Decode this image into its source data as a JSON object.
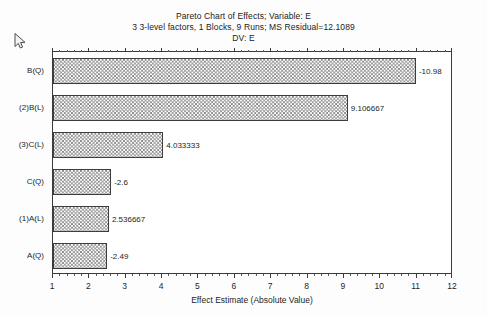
{
  "chart_data": {
    "type": "bar",
    "orientation": "horizontal",
    "title": "Pareto Chart of Effects; Variable: E",
    "subtitle": "3 3-level factors, 1 Blocks, 9 Runs; MS Residual=12.1089",
    "subtitle2": "DV: E",
    "xlabel": "Effect Estimate (Absolute Value)",
    "ylabel": "",
    "xlim": [
      1,
      12
    ],
    "xticks": [
      1,
      2,
      3,
      4,
      5,
      6,
      7,
      8,
      9,
      10,
      11,
      12
    ],
    "xtick_labels": [
      "1",
      "2",
      "3",
      "4",
      "5",
      "6",
      "7",
      "8",
      "9",
      "10",
      "11",
      "12"
    ],
    "grid": false,
    "legend": "none",
    "categories": [
      "B(Q)",
      "(2)B(L)",
      "(3)C(L)",
      "C(Q)",
      "(1)A(L)",
      "A(Q)"
    ],
    "values": [
      10.98,
      9.106667,
      4.033333,
      2.6,
      2.536667,
      2.49
    ],
    "data_labels": [
      "-10.98",
      "9.106667",
      "4.033333",
      "-2.6",
      "2.536667",
      "-2.49"
    ],
    "bars": [
      {
        "category": "B(Q)",
        "value": 10.98,
        "label": "-10.98"
      },
      {
        "category": "(2)B(L)",
        "value": 9.106667,
        "label": "9.106667"
      },
      {
        "category": "(3)C(L)",
        "value": 4.033333,
        "label": "4.033333"
      },
      {
        "category": "C(Q)",
        "value": 2.6,
        "label": "-2.6"
      },
      {
        "category": "(1)A(L)",
        "value": 2.536667,
        "label": "2.536667"
      },
      {
        "category": "A(Q)",
        "value": 2.49,
        "label": "-2.49"
      }
    ],
    "colors": {
      "bar_fill": "#7d7d7d",
      "bar_edge": "#3d3d3d",
      "axis": "#3b3b3b",
      "text": "#1d1d1d",
      "background": "#fdfdfd",
      "plot_background": "#ffffff"
    }
  },
  "cursor": {
    "icon": "mouse-pointer-icon"
  }
}
